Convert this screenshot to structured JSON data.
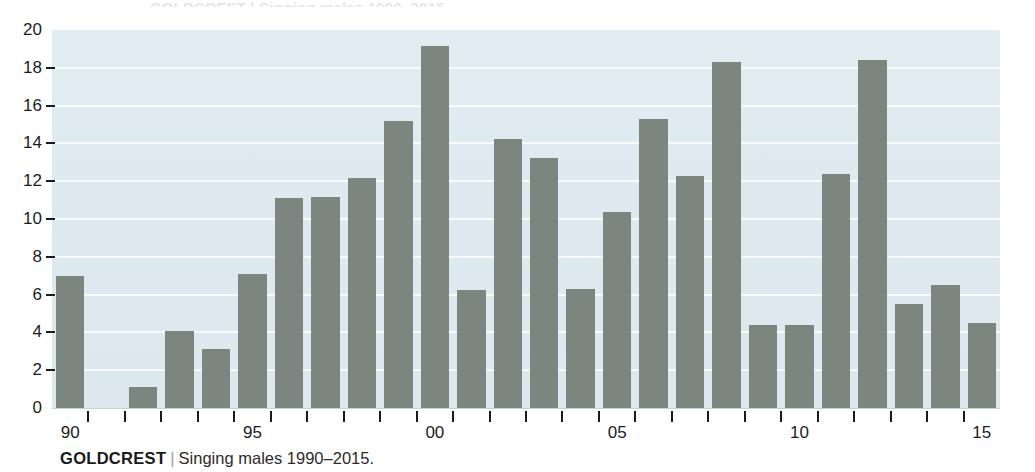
{
  "caption": {
    "name": "GOLDCREST",
    "separator": "|",
    "description": "Singing males 1990–2015."
  },
  "top_bleed_text": "GOLDCREST | Singing males 1990–2015.",
  "colors": {
    "bar": "#7b867e",
    "plot_background": "#dfeaf0",
    "gridline": "#f7fbfc",
    "text": "#1c1c1c",
    "caption_separator": "#9aa0a4"
  },
  "chart_data": {
    "type": "bar",
    "title": "GOLDCREST | Singing males 1990–2015.",
    "xlabel": "",
    "ylabel": "",
    "ylim": [
      0,
      20
    ],
    "grid": true,
    "legend": null,
    "y_ticks": [
      0,
      2,
      4,
      6,
      8,
      10,
      12,
      14,
      16,
      18,
      20
    ],
    "x_tick_labels": [
      "90",
      "95",
      "00",
      "05",
      "10",
      "15"
    ],
    "x_tick_years": [
      1990,
      1995,
      2000,
      2005,
      2010,
      2015
    ],
    "categories": [
      "1990",
      "1991",
      "1992",
      "1993",
      "1994",
      "1995",
      "1996",
      "1997",
      "1998",
      "1999",
      "2000",
      "2001",
      "2002",
      "2003",
      "2004",
      "2005",
      "2006",
      "2007",
      "2008",
      "2009",
      "2010",
      "2011",
      "2012",
      "2013",
      "2014",
      "2015"
    ],
    "values": [
      7.0,
      0,
      1.1,
      4.1,
      3.1,
      7.1,
      11.1,
      11.15,
      12.15,
      15.2,
      19.15,
      6.25,
      14.25,
      13.25,
      6.3,
      10.35,
      15.3,
      12.3,
      18.3,
      4.4,
      4.4,
      12.4,
      18.4,
      5.5,
      6.5,
      4.5
    ]
  }
}
